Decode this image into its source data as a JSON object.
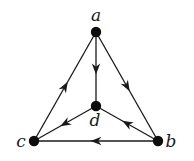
{
  "diagram": {
    "type": "directed-graph",
    "nodes": [
      {
        "id": "a",
        "label": "a",
        "x": 96,
        "y": 32,
        "label_x": 96,
        "label_y": 21
      },
      {
        "id": "b",
        "label": "b",
        "x": 158,
        "y": 141,
        "label_x": 171,
        "label_y": 147
      },
      {
        "id": "c",
        "label": "c",
        "x": 34,
        "y": 141,
        "label_x": 21,
        "label_y": 147
      },
      {
        "id": "d",
        "label": "d",
        "x": 96,
        "y": 106,
        "label_x": 95,
        "label_y": 126
      }
    ],
    "edges": [
      {
        "from": "a",
        "to": "d"
      },
      {
        "from": "a",
        "to": "b"
      },
      {
        "from": "c",
        "to": "a"
      },
      {
        "from": "b",
        "to": "c"
      },
      {
        "from": "d",
        "to": "c"
      },
      {
        "from": "b",
        "to": "d"
      }
    ],
    "colors": {
      "line": "#1a1a1a",
      "node": "#0d0d0d",
      "background": "#ffffff"
    }
  }
}
